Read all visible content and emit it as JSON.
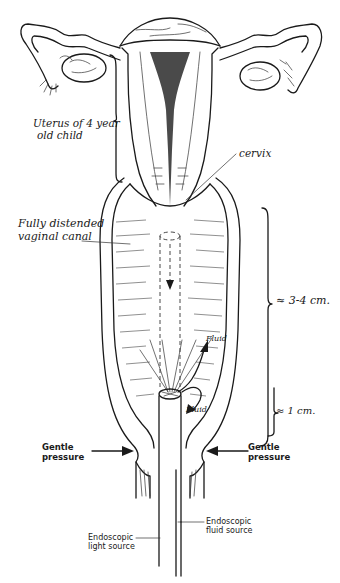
{
  "figure": {
    "type": "medical illustration",
    "labels": {
      "uterus": [
        "Uterus of 4 year",
        "old child"
      ],
      "cervix": "cervix",
      "vaginal_canal": [
        "Fully distended",
        "vaginal canal"
      ],
      "length_upper": "≈ 3-4 cm.",
      "length_lower": "≈ 1 cm.",
      "fluid_upper": "Fluid",
      "fluid_lower": "Fluid",
      "pressure_left": [
        "Gentle",
        "pressure"
      ],
      "pressure_right": [
        "Gentle",
        "pressure"
      ],
      "light_source": [
        "Endoscopic",
        "light source"
      ],
      "fluid_source": [
        "Endoscopic",
        "fluid source"
      ]
    }
  }
}
